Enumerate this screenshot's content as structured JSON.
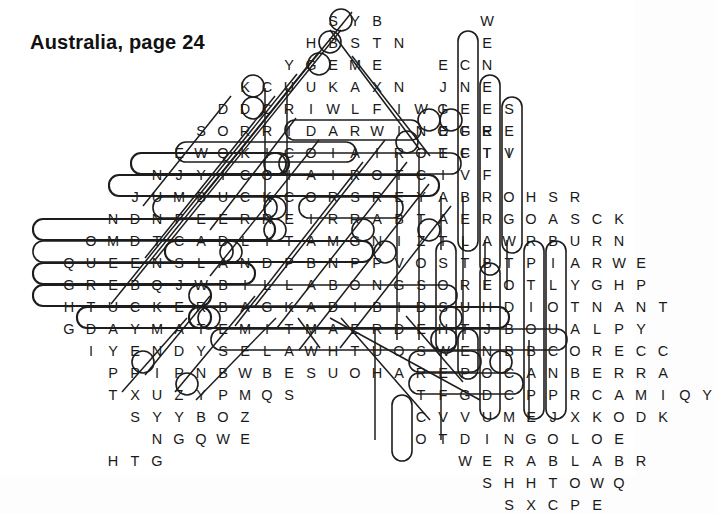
{
  "page": {
    "title": "Australia, page 24",
    "type": "word-search-puzzle",
    "width": 635,
    "height": 475,
    "background": "#ffffff",
    "ink": "#1a1a1a"
  },
  "grid": {
    "cell_width": 22,
    "cell_height": 22,
    "origin_x": 14,
    "origin_y": 10,
    "shape": "diamond",
    "rows": [
      {
        "index": 0,
        "start_col": 14,
        "letters": "SYB"
      },
      {
        "index": 1,
        "start_col": 13,
        "letters": "HBSTN"
      },
      {
        "index": 2,
        "start_col": 12,
        "letters": "YGEME"
      },
      {
        "index": 3,
        "start_col": 10,
        "letters": "KCUUKAXN"
      },
      {
        "index": 4,
        "start_col": 9,
        "letters": "DDCRIWLFIWI"
      },
      {
        "index": 5,
        "start_col": 8,
        "letters": "SORRIDARWINOGE"
      },
      {
        "index": 6,
        "start_col": 7,
        "letters": "EWQKICOIAIROTCIV"
      },
      {
        "index": 7,
        "start_col": 6,
        "letters": "NJYICOIAIROTCIVF"
      },
      {
        "index": 8,
        "start_col": 5,
        "letters": "JUMBUCKCORSREYABROHSR"
      },
      {
        "index": 9,
        "start_col": 4,
        "letters": "NDNFEERREIRRABTAERGOASCK"
      },
      {
        "index": 10,
        "start_col": 3,
        "letters": "OMDTCADLITAMGNIZTLAWRBURN"
      },
      {
        "index": 11,
        "start_col": 2,
        "letters": "QUEENSLANDPBNPPVOSTBTPIARWE"
      },
      {
        "index": 12,
        "start_col": 2,
        "letters": "GREBQJWBILLABONGSOREOTLYGHP"
      },
      {
        "index": 13,
        "start_col": 2,
        "letters": "HTUCKERBAGKADIBIDSUHDIOTNANT"
      },
      {
        "index": 14,
        "start_col": 2,
        "letters": "GDAYMATEMITMAERDEHTJBOUALPY"
      },
      {
        "index": 15,
        "start_col": 3,
        "letters": "IYENDYSELAWHTUOSWENBBCORECC"
      },
      {
        "index": 16,
        "start_col": 4,
        "letters": "PPIPNBWBESUOHAREPOCANBERRA"
      },
      {
        "index": 17,
        "start_col": 4,
        "letters": "TXUZYPMQS"
      },
      {
        "index": 18,
        "start_col": 5,
        "letters": "SYYBOZ"
      },
      {
        "index": 19,
        "start_col": 6,
        "letters": "NGQWE"
      },
      {
        "index": 20,
        "start_col": 4,
        "letters": "HTG"
      }
    ],
    "right_rows": [
      {
        "index": 0,
        "start_col": 21,
        "letters": "W"
      },
      {
        "index": 1,
        "start_col": 21,
        "letters": "E"
      },
      {
        "index": 2,
        "start_col": 19,
        "letters": "ECN"
      },
      {
        "index": 3,
        "start_col": 19,
        "letters": "JNE"
      },
      {
        "index": 4,
        "start_col": 19,
        "letters": "GEES"
      },
      {
        "index": 5,
        "start_col": 19,
        "letters": "EFRE"
      },
      {
        "index": 6,
        "start_col": 19,
        "letters": "EFTI"
      },
      {
        "index": 17,
        "start_col": 18,
        "letters": "TFGDCPPRCAMIQY"
      },
      {
        "index": 18,
        "start_col": 18,
        "letters": "CVVUMEJXKODK"
      },
      {
        "index": 19,
        "start_col": 18,
        "letters": "OTDINGOLOE"
      },
      {
        "index": 20,
        "start_col": 20,
        "letters": "WERABLABR"
      },
      {
        "index": 21,
        "start_col": 21,
        "letters": "SHHTOWQ"
      },
      {
        "index": 22,
        "start_col": 22,
        "letters": "SXCPE"
      }
    ]
  },
  "found_words": [
    {
      "word": "JUMBUCK",
      "direction": "horizontal"
    },
    {
      "word": "QUEENSLAND",
      "direction": "horizontal"
    },
    {
      "word": "BILLABONG",
      "direction": "horizontal"
    },
    {
      "word": "TUCKERBAG",
      "direction": "horizontal"
    },
    {
      "word": "GDAYMATE",
      "direction": "horizontal"
    },
    {
      "word": "SYDNEY",
      "direction": "horizontal"
    },
    {
      "word": "DARWIN",
      "direction": "horizontal"
    },
    {
      "word": "CANBERRA",
      "direction": "horizontal"
    },
    {
      "word": "DINGO",
      "direction": "horizontal"
    },
    {
      "word": "VICTORIA",
      "direction": "horizontal-reversed"
    },
    {
      "word": "BARRIERREEF",
      "direction": "horizontal-reversed"
    },
    {
      "word": "GREATBARRIER",
      "direction": "horizontal-reversed"
    },
    {
      "word": "NEWSOUTHWALES",
      "direction": "horizontal-reversed"
    },
    {
      "word": "OPERAHOUSE",
      "direction": "horizontal-reversed"
    },
    {
      "word": "THEDREAMTIME",
      "direction": "horizontal-reversed"
    },
    {
      "word": "EMU",
      "direction": "horizontal"
    },
    {
      "word": "KOALA",
      "direction": "diagonal"
    },
    {
      "word": "WOMBAT",
      "direction": "diagonal"
    },
    {
      "word": "BOOMERANG",
      "direction": "diagonal"
    },
    {
      "word": "ULURU",
      "direction": "diagonal"
    },
    {
      "word": "OUTBACK",
      "direction": "diagonal"
    },
    {
      "word": "CROCODILE",
      "direction": "vertical"
    },
    {
      "word": "KANGAROO",
      "direction": "vertical"
    },
    {
      "word": "WALLABY",
      "direction": "vertical"
    },
    {
      "word": "PERTH",
      "direction": "vertical"
    },
    {
      "word": "BRISBANE",
      "direction": "vertical"
    },
    {
      "word": "TASMANIA",
      "direction": "vertical"
    },
    {
      "word": "ADELAIDE",
      "direction": "vertical"
    },
    {
      "word": "SHEARER",
      "direction": "vertical"
    }
  ]
}
